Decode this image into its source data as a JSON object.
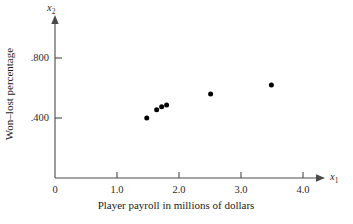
{
  "chart_data": {
    "type": "scatter",
    "title": "",
    "xlabel": "Player payroll in millions of dollars",
    "ylabel": "Won–lost percentage",
    "x_var": "x",
    "x_var_sub": "1",
    "y_var": "x",
    "y_var_sub": "2",
    "xlim": [
      0,
      4.3
    ],
    "ylim": [
      0,
      0.95
    ],
    "grid": false,
    "legend": null,
    "x_ticks": [
      {
        "value": 0,
        "label": "0"
      },
      {
        "value": 1.0,
        "label": "1.0"
      },
      {
        "value": 2.0,
        "label": "2.0"
      },
      {
        "value": 3.0,
        "label": "3.0"
      },
      {
        "value": 4.0,
        "label": "4.0"
      }
    ],
    "y_ticks": [
      {
        "value": 0.4,
        "label": ".400"
      },
      {
        "value": 0.8,
        "label": ".800"
      }
    ],
    "marker": {
      "shape": "circle",
      "color": "#000000",
      "size_px": 5
    },
    "points": [
      {
        "x": 1.48,
        "y": 0.4
      },
      {
        "x": 1.64,
        "y": 0.455
      },
      {
        "x": 1.72,
        "y": 0.475
      },
      {
        "x": 1.8,
        "y": 0.487
      },
      {
        "x": 2.51,
        "y": 0.56
      },
      {
        "x": 3.49,
        "y": 0.62
      }
    ]
  },
  "figure": {
    "background_color": "#ffffff",
    "axis_color": "#4a4a4a",
    "text_color": "#1a1a1a"
  }
}
